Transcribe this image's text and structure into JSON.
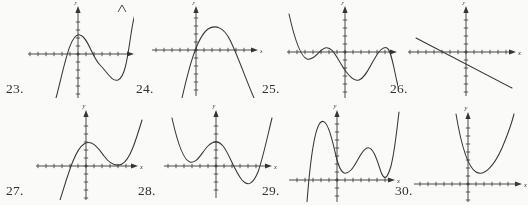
{
  "page": {
    "kind": "textbook-exercise-figures",
    "background_color": "#fdfdfc",
    "ink_color": "#2f2f2f",
    "axis_label_x": "x",
    "axis_label_y": "y"
  },
  "figures": [
    {
      "number": "23.",
      "label_x": 6,
      "label_y": 82,
      "frame": {
        "x": 22,
        "y": 2,
        "w": 112,
        "h": 96
      },
      "axes": {
        "ox": 56,
        "oy": 52,
        "x_left": -50,
        "x_right": 56,
        "y_up": -48,
        "y_down": 44,
        "tick": 8
      },
      "curve_name": "cubic-positive-leading",
      "path": "M 34 96 C 42 66, 48 30, 58 33 C 66 35, 70 55, 78 63 C 86 71, 90 80, 96 78 C 104 75, 106 50, 110 26 C 112 14, 114 8, 116 4",
      "arrow_ends": [
        "top-right"
      ]
    },
    {
      "number": "24.",
      "label_x": 136,
      "label_y": 82,
      "frame": {
        "x": 150,
        "y": 2,
        "w": 112,
        "h": 96
      },
      "axes": {
        "ox": 46,
        "oy": 48,
        "x_left": -44,
        "x_right": 62,
        "y_up": -44,
        "y_down": 46,
        "tick": 8
      },
      "curve_name": "parabola-negative-leading",
      "path": "M 32 96 C 38 70, 46 36, 58 27 C 66 22, 74 26, 80 38 C 88 54, 96 78, 104 96",
      "arrow_ends": []
    },
    {
      "number": "25.",
      "label_x": 262,
      "label_y": 82,
      "frame": {
        "x": 283,
        "y": 2,
        "w": 115,
        "h": 96
      },
      "axes": {
        "ox": 62,
        "oy": 50,
        "x_left": -58,
        "x_right": 52,
        "y_up": -46,
        "y_down": 46,
        "tick": 8
      },
      "curve_name": "quartic-negative-leading-w",
      "path": "M 6 12 C 10 30, 16 54, 24 57 C 31 59, 36 48, 42 46 C 48 44, 52 52, 58 62 C 64 72, 70 80, 76 78 C 82 76, 86 66, 92 56 C 96 49, 100 44, 104 46 C 108 48, 110 62, 114 80 C 116 88, 117 92, 118 96",
      "arrow_ends": []
    },
    {
      "number": "26.",
      "label_x": 390,
      "label_y": 82,
      "frame": {
        "x": 404,
        "y": 2,
        "w": 120,
        "h": 96
      },
      "axes": {
        "ox": 62,
        "oy": 50,
        "x_left": -58,
        "x_right": 50,
        "y_up": -46,
        "y_down": 44,
        "tick": 8
      },
      "curve_name": "line-negative-slope",
      "path": "M 12 36 L 108 86",
      "arrow_ends": []
    },
    {
      "number": "27.",
      "label_x": 6,
      "label_y": 184,
      "frame": {
        "x": 32,
        "y": 104,
        "w": 112,
        "h": 96
      },
      "axes": {
        "ox": 54,
        "oy": 62,
        "x_left": -50,
        "x_right": 52,
        "y_up": -56,
        "y_down": 34,
        "tick": 8
      },
      "curve_name": "cubic-positive-leading-shifted-up",
      "path": "M 28 96 C 34 78, 42 46, 52 40 C 60 35, 66 44, 72 52 C 78 60, 84 63, 90 60 C 98 56, 104 36, 110 16",
      "arrow_ends": []
    },
    {
      "number": "28.",
      "label_x": 138,
      "label_y": 184,
      "frame": {
        "x": 160,
        "y": 104,
        "w": 118,
        "h": 96
      },
      "axes": {
        "ox": 56,
        "oy": 62,
        "x_left": -52,
        "x_right": 56,
        "y_up": -56,
        "y_down": 32,
        "tick": 8
      },
      "curve_name": "quartic-positive-leading-w",
      "path": "M 12 14 C 16 32, 22 56, 30 58 C 37 60, 42 48, 48 42 C 53 37, 58 36, 63 42 C 69 49, 74 66, 82 76 C 88 83, 93 80, 98 68 C 103 54, 108 30, 112 14",
      "arrow_ends": []
    },
    {
      "number": "29.",
      "label_x": 262,
      "label_y": 184,
      "frame": {
        "x": 285,
        "y": 104,
        "w": 116,
        "h": 98
      },
      "axes": {
        "ox": 52,
        "oy": 76,
        "x_left": -48,
        "x_right": 58,
        "y_up": -70,
        "y_down": 22,
        "tick": 8
      },
      "curve_name": "quintic-positive-leading-w-above-axis",
      "path": "M 22 98 C 24 72, 28 24, 36 18 C 43 13, 48 40, 52 56 C 56 70, 60 72, 66 66 C 72 60, 76 46, 82 44 C 88 42, 92 56, 96 68 C 99 76, 102 76, 106 62 C 110 46, 112 24, 114 8",
      "arrow_ends": []
    },
    {
      "number": "30.",
      "label_x": 395,
      "label_y": 184,
      "frame": {
        "x": 410,
        "y": 104,
        "w": 118,
        "h": 98
      },
      "axes": {
        "ox": 58,
        "oy": 80,
        "x_left": -54,
        "x_right": 54,
        "y_up": -72,
        "y_down": 18,
        "tick": 8
      },
      "curve_name": "parabola-positive-leading",
      "path": "M 46 10 C 50 34, 56 62, 66 68 C 74 73, 84 62, 92 44 C 98 30, 102 18, 104 10",
      "arrow_ends": []
    }
  ]
}
